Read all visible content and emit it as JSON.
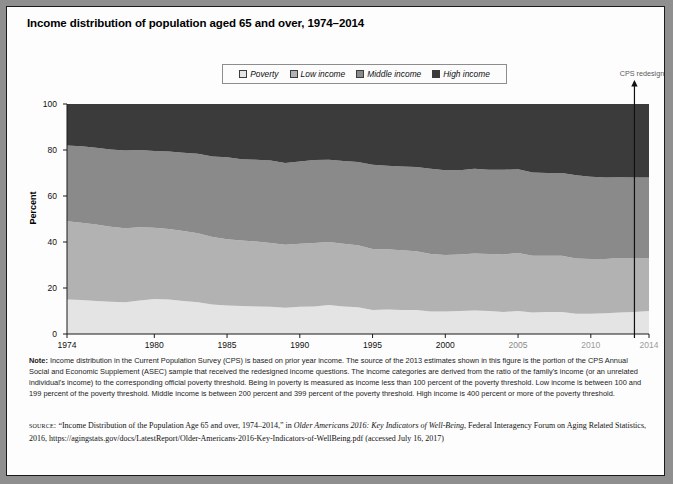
{
  "figure": {
    "title": "Income distribution of population aged 65 and over, 1974–2014",
    "annotation": "CPS redesign"
  },
  "legend": {
    "items": [
      {
        "label": "Poverty",
        "color": "#e4e4e4"
      },
      {
        "label": "Low income",
        "color": "#b2b2b2"
      },
      {
        "label": "Middle income",
        "color": "#8a8a8a"
      },
      {
        "label": "High income",
        "color": "#3b3b3b"
      }
    ]
  },
  "axes": {
    "ylabel": "Percent",
    "yticks": [
      "0",
      "20",
      "40",
      "60",
      "80",
      "100"
    ],
    "xticks": [
      "1974",
      "1980",
      "1985",
      "1990",
      "1995",
      "2000",
      "2005",
      "2010",
      "2014"
    ]
  },
  "note": {
    "label": "Note:",
    "text": " Income distribution in the Current Population Survey (CPS) is based on prior year income. The source of the 2013 estimates shown in this figure is the portion of the CPS Annual Social and Economic Supplement (ASEC) sample that received the redesigned income questions. The income categories are derived from the ratio of the family's income (or an unrelated individual's income) to the corresponding official poverty threshold. Being in poverty is measured as income less than 100 percent of the poverty threshold. Low income is between 100 and 199 percent of the poverty threshold. Middle income is between 200 percent and 399 percent of the poverty threshold. High income is 400 percent or more of the poverty threshold."
  },
  "source": {
    "label": "source:",
    "line1_pre": " “Income Distribution of the Population Age 65 and over, 1974–2014,” in ",
    "line1_italic": "Older Americans 2016: Key Indicators of Well-Being",
    "line1_post": ", Federal Interagency Forum on Aging Related Statistics, 2016, https://agingstats.gov/docs/LatestReport/Older-Americans-2016-Key-Indicators-of-WellBeing.pdf (accessed July 16, 2017)"
  },
  "chart_data": {
    "type": "area",
    "title": "Income distribution of population aged 65 and over, 1974–2014",
    "xlabel": "",
    "ylabel": "Percent",
    "ylim": [
      0,
      100
    ],
    "xlim": [
      1974,
      2014
    ],
    "grid": false,
    "legend_position": "top",
    "stacked": true,
    "units": "percent",
    "x": [
      1974,
      1975,
      1976,
      1977,
      1978,
      1979,
      1980,
      1981,
      1982,
      1983,
      1984,
      1985,
      1986,
      1987,
      1988,
      1989,
      1990,
      1991,
      1992,
      1993,
      1994,
      1995,
      1996,
      1997,
      1998,
      1999,
      2000,
      2001,
      2002,
      2003,
      2004,
      2005,
      2006,
      2007,
      2008,
      2009,
      2010,
      2011,
      2012,
      2013,
      2014
    ],
    "series": [
      {
        "name": "Poverty",
        "color": "#e4e4e4",
        "values": [
          15.0,
          14.8,
          14.4,
          14.0,
          13.8,
          14.6,
          15.2,
          15.0,
          14.4,
          13.8,
          12.8,
          12.4,
          12.2,
          12.0,
          11.8,
          11.4,
          11.8,
          12.0,
          12.6,
          12.0,
          11.6,
          10.4,
          10.6,
          10.4,
          10.4,
          9.8,
          9.8,
          10.0,
          10.2,
          10.0,
          9.6,
          10.0,
          9.4,
          9.6,
          9.6,
          8.8,
          8.8,
          9.0,
          9.4,
          9.6,
          10.0
        ]
      },
      {
        "name": "Low income",
        "color": "#b2b2b2",
        "values": [
          34.0,
          33.6,
          33.2,
          32.6,
          32.2,
          31.8,
          31.0,
          30.6,
          30.4,
          30.0,
          29.4,
          28.8,
          28.4,
          28.2,
          27.8,
          27.4,
          27.4,
          27.6,
          27.4,
          27.2,
          27.0,
          26.6,
          26.2,
          26.0,
          25.6,
          25.0,
          24.6,
          24.6,
          24.8,
          24.8,
          25.0,
          25.2,
          24.6,
          24.4,
          24.4,
          24.0,
          23.8,
          23.6,
          23.6,
          23.4,
          23.0
        ]
      },
      {
        "name": "Middle income",
        "color": "#8a8a8a",
        "values": [
          33.0,
          33.2,
          33.4,
          33.6,
          33.8,
          33.6,
          33.4,
          33.8,
          34.0,
          34.6,
          35.0,
          35.6,
          35.4,
          35.6,
          35.8,
          35.6,
          35.8,
          36.0,
          35.8,
          36.0,
          36.2,
          36.6,
          36.4,
          36.4,
          36.6,
          37.0,
          36.8,
          36.6,
          36.8,
          36.6,
          36.8,
          36.4,
          36.2,
          36.0,
          36.0,
          36.2,
          35.8,
          35.4,
          35.2,
          35.0,
          35.0
        ]
      },
      {
        "name": "High income",
        "color": "#3b3b3b",
        "values": [
          18.0,
          18.4,
          19.0,
          19.8,
          20.2,
          20.0,
          20.4,
          20.6,
          21.2,
          21.6,
          22.8,
          23.2,
          24.0,
          24.2,
          24.6,
          25.6,
          25.0,
          24.4,
          24.2,
          24.8,
          25.2,
          26.4,
          26.8,
          27.2,
          27.4,
          28.2,
          28.8,
          28.8,
          28.2,
          28.6,
          28.6,
          28.4,
          29.8,
          30.0,
          30.0,
          31.0,
          31.6,
          32.0,
          31.8,
          32.0,
          32.0
        ]
      }
    ],
    "annotations": [
      {
        "text": "CPS redesign",
        "x": 2013,
        "type": "vertical-line-with-arrow"
      }
    ]
  }
}
